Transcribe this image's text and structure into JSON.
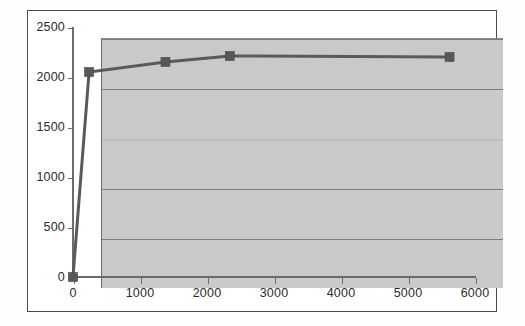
{
  "chart_data": {
    "type": "line",
    "title": "",
    "subtitle": "",
    "xlabel": "",
    "ylabel": "",
    "xlim": [
      0,
      6000
    ],
    "ylim": [
      0,
      2500
    ],
    "grid": true,
    "legend": false,
    "legend_position": "none",
    "series": [
      {
        "name": "series-1",
        "marker": "square",
        "color": "#585858",
        "points": [
          {
            "x": 0,
            "y": 0
          },
          {
            "x": 240,
            "y": 2050
          },
          {
            "x": 1380,
            "y": 2150
          },
          {
            "x": 2340,
            "y": 2210
          },
          {
            "x": 5620,
            "y": 2200
          }
        ]
      }
    ],
    "x_ticks": [
      {
        "value": 0,
        "label": "0"
      },
      {
        "value": 1000,
        "label": "1000"
      },
      {
        "value": 2000,
        "label": "2000"
      },
      {
        "value": 3000,
        "label": "3000"
      },
      {
        "value": 4000,
        "label": "4000"
      },
      {
        "value": 5000,
        "label": "5000"
      },
      {
        "value": 6000,
        "label": "6000"
      }
    ],
    "y_ticks": [
      {
        "value": 0,
        "label": "0"
      },
      {
        "value": 500,
        "label": "500"
      },
      {
        "value": 1000,
        "label": "1000"
      },
      {
        "value": 1500,
        "label": "1500"
      },
      {
        "value": 2000,
        "label": "2000"
      },
      {
        "value": 2500,
        "label": "2500"
      }
    ],
    "colors": {
      "plot_background": "#c9c9c9",
      "figure_background": "#ffffff",
      "gridline": "#7d7d7d",
      "axis": "#6b6b6b",
      "series": "#5a5a5a",
      "tick_text": "#2b2b2b",
      "frame_border": "#4a4a4a"
    }
  },
  "geometry": {
    "plot_left": 73,
    "plot_top": 27,
    "plot_width": 402,
    "plot_height": 250
  }
}
